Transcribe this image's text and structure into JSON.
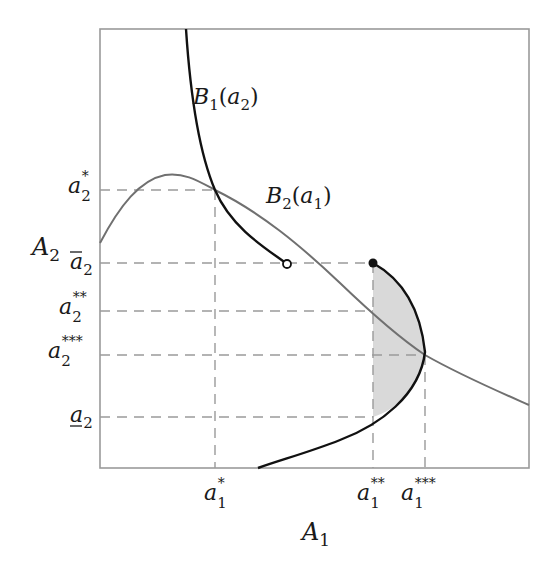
{
  "diagram": {
    "type": "best-response diagram",
    "axes": {
      "x_label": "A",
      "x_label_sub": "1",
      "y_label": "A",
      "y_label_sub": "2"
    },
    "curves": [
      {
        "name": "B",
        "sub": "1",
        "arg": "a",
        "arg_sub": "2",
        "color": "#111111"
      },
      {
        "name": "B",
        "sub": "2",
        "arg": "a",
        "arg_sub": "1",
        "color": "#707070"
      }
    ],
    "y_ticks": [
      {
        "id": "a2_star",
        "base": "a",
        "sub": "2",
        "sup": "*"
      },
      {
        "id": "a2_bar",
        "base": "a",
        "sub": "2",
        "sup": "",
        "mark": "overline"
      },
      {
        "id": "a2_2star",
        "base": "a",
        "sub": "2",
        "sup": "**"
      },
      {
        "id": "a2_3star",
        "base": "a",
        "sub": "2",
        "sup": "***"
      },
      {
        "id": "a2_under",
        "base": "a",
        "sub": "2",
        "sup": "",
        "mark": "underline"
      }
    ],
    "x_ticks": [
      {
        "id": "a1_star",
        "base": "a",
        "sub": "1",
        "sup": "*"
      },
      {
        "id": "a1_2star",
        "base": "a",
        "sub": "1",
        "sup": "**"
      },
      {
        "id": "a1_3star",
        "base": "a",
        "sub": "1",
        "sup": "***"
      }
    ],
    "markers": [
      {
        "name": "open-endpoint",
        "filled": false
      },
      {
        "name": "closed-endpoint",
        "filled": true
      }
    ],
    "shaded_region_color": "#d9d9d9",
    "frame_color": "#9a9a9a",
    "guide_color": "#9a9a9a"
  }
}
